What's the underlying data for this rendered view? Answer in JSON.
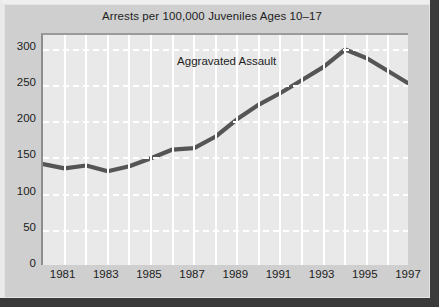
{
  "figure": {
    "title": "Arrests per 100,000 Juveniles Ages 10–17",
    "series_annotation": "Aggravated Assault",
    "background_color": "#cfcfcf",
    "plot_background_color": "#e9e9e9",
    "line_color": "#555555",
    "gridline_color": "#ffffff",
    "text_color": "#1d1d1d"
  },
  "chart_data": {
    "type": "line",
    "title": "Arrests per 100,000 Juveniles Ages 10–17",
    "xlabel": "",
    "ylabel": "",
    "ylim": [
      0,
      320
    ],
    "xlim": [
      1980,
      1997
    ],
    "grid": true,
    "legend_position": "inline-annotation",
    "yticks": [
      0,
      50,
      100,
      150,
      200,
      250,
      300
    ],
    "ytick_labels": [
      "0",
      "50",
      "100",
      "150",
      "200",
      "250",
      "300"
    ],
    "xticks": [
      1981,
      1983,
      1985,
      1987,
      1989,
      1991,
      1993,
      1995,
      1997
    ],
    "xtick_labels": [
      "1981",
      "1983",
      "1985",
      "1987",
      "1989",
      "1991",
      "1993",
      "1995",
      "1997"
    ],
    "annotations": [
      {
        "text": "Aggravated Assault",
        "x": 1988.6,
        "y": 278
      }
    ],
    "series": [
      {
        "name": "Aggravated Assault",
        "color": "#555555",
        "x": [
          1980,
          1981,
          1982,
          1983,
          1984,
          1985,
          1986,
          1987,
          1988,
          1989,
          1990,
          1991,
          1992,
          1993,
          1994,
          1995,
          1996,
          1997
        ],
        "values": [
          142,
          136,
          140,
          132,
          139,
          150,
          162,
          164,
          180,
          204,
          224,
          240,
          258,
          276,
          300,
          288,
          270,
          252
        ]
      }
    ]
  }
}
